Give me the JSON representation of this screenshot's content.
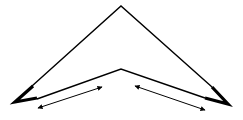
{
  "diagram": {
    "stroke_color": "#000000",
    "background": "#ffffff",
    "outer_edge": {
      "apex": [
        121,
        6
      ],
      "left_end": [
        32,
        86
      ],
      "right_end": [
        212,
        87
      ]
    },
    "inner_edge": {
      "apex": [
        121,
        69
      ],
      "left_end": [
        37,
        99
      ],
      "right_end": [
        205,
        98
      ]
    },
    "tips": {
      "left": {
        "points": [
          [
            32,
            86
          ],
          [
            15,
            102
          ],
          [
            37,
            99
          ]
        ]
      },
      "right": {
        "points": [
          [
            212,
            87
          ],
          [
            228,
            104
          ],
          [
            205,
            98
          ]
        ]
      }
    },
    "arrows": [
      {
        "name": "left-double-arrow",
        "from": [
          38,
          108
        ],
        "to": [
          102,
          87
        ]
      },
      {
        "name": "right-double-arrow",
        "from": [
          135,
          86
        ],
        "to": [
          205,
          110
        ]
      }
    ]
  }
}
